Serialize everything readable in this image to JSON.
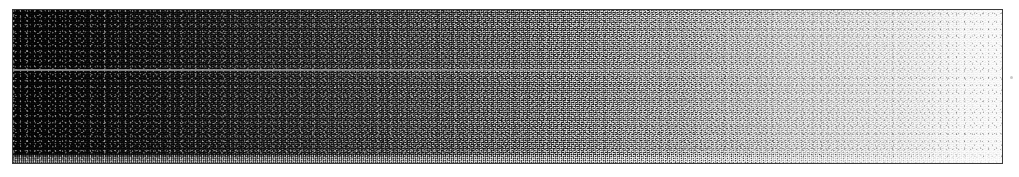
{
  "figure": {
    "kind": "grayscale-density-wedge-scan",
    "caption": "",
    "width_px": 1019,
    "height_px": 177
  },
  "plate": {
    "left_px": 12,
    "top_px": 9,
    "width_px": 991,
    "height_px": 155,
    "border_color": "#3a3a3a",
    "background_color": "#ffffff",
    "page_color": "#ffffff"
  },
  "chart_data": {
    "type": "heatmap",
    "title": "",
    "subtitle": "",
    "xlabel": "",
    "ylabel": "",
    "grid": false,
    "legend_position": "none",
    "orientation": "horizontal",
    "x": [
      0,
      6,
      14,
      22,
      30,
      38,
      45,
      51,
      57,
      63,
      69,
      74,
      79,
      84,
      89,
      93,
      96,
      100
    ],
    "values": [
      5,
      10,
      19,
      34,
      51,
      71,
      92,
      111,
      130,
      151,
      171,
      189,
      205,
      218,
      229,
      238,
      245,
      249
    ],
    "xlim": [
      0,
      100
    ],
    "ylim": [
      0,
      255
    ],
    "colormap": "grayscale",
    "stops": [
      "#050505",
      "#0a0a0a",
      "#131313",
      "#222222",
      "#333333",
      "#474747",
      "#5c5c5c",
      "#6f6f6f",
      "#828282",
      "#979797",
      "#ababab",
      "#bdbdbd",
      "#cdcdcd",
      "#dadada",
      "#e5e5e5",
      "#eeeeee",
      "#f5f5f5",
      "#f9f9f9"
    ],
    "annotations": [
      {
        "name": "scanline-artifact",
        "kind": "horizontal-line",
        "y_px": 59,
        "note": "faint bright horizontal scan artefact"
      },
      {
        "name": "bottom-band",
        "kind": "horizontal-band",
        "height_px": 9,
        "note": "lighter dithered band along lower edge"
      },
      {
        "name": "margin-speck",
        "kind": "dot",
        "x_px": 1010,
        "y_px": 76,
        "note": "isolated speck in right white margin"
      }
    ]
  }
}
